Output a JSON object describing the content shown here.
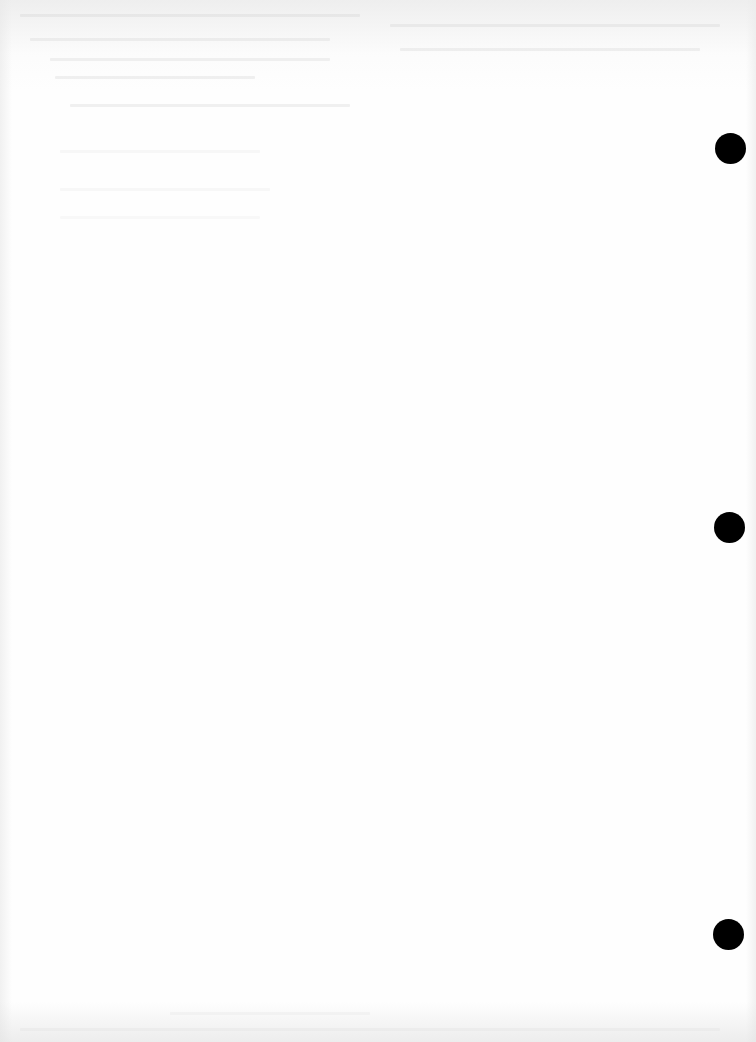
{
  "document": {
    "type": "blank scanned page",
    "paper_color": "#fefefe",
    "punch_hole_color": "#000000",
    "punch_holes": [
      {
        "id": "top",
        "cx": 730,
        "cy": 148,
        "diameter": 31
      },
      {
        "id": "middle",
        "cx": 729,
        "cy": 527,
        "diameter": 31
      },
      {
        "id": "bottom",
        "cx": 728,
        "cy": 934,
        "diameter": 31
      }
    ],
    "text": ""
  }
}
